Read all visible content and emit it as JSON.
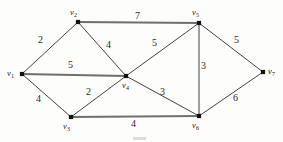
{
  "figure": {
    "type": "weighted-undirected-graph",
    "caption": "",
    "width": 283,
    "height": 142,
    "background_color": "#fdfdfc",
    "edge_color": "#2e2e2e",
    "highlight_edge_color": "#6f6f6f",
    "vertex_color": "#121212"
  },
  "vertices": [
    {
      "id": "v1",
      "label": "v",
      "sub": "1",
      "x": 22,
      "y": 74,
      "label_x": 7,
      "label_y": 69
    },
    {
      "id": "v2",
      "label": "v",
      "sub": "2",
      "x": 78,
      "y": 22,
      "label_x": 70,
      "label_y": 8
    },
    {
      "id": "v3",
      "label": "v",
      "sub": "3",
      "x": 71,
      "y": 117,
      "label_x": 63,
      "label_y": 122
    },
    {
      "id": "v4",
      "label": "v",
      "sub": "4",
      "x": 126,
      "y": 76,
      "label_x": 122,
      "label_y": 81
    },
    {
      "id": "v5",
      "label": "v",
      "sub": "5",
      "x": 199,
      "y": 23,
      "label_x": 192,
      "label_y": 8
    },
    {
      "id": "v6",
      "label": "v",
      "sub": "6",
      "x": 199,
      "y": 116,
      "label_x": 192,
      "label_y": 121
    },
    {
      "id": "v7",
      "label": "v",
      "sub": "7",
      "x": 263,
      "y": 72,
      "label_x": 268,
      "label_y": 67
    }
  ],
  "edges": [
    {
      "id": "e-v1-v2",
      "from": "v1",
      "to": "v2",
      "weight": "2",
      "weight_x": 38,
      "weight_y": 35,
      "thick": false
    },
    {
      "id": "e-v1-v4",
      "from": "v1",
      "to": "v4",
      "weight": "5",
      "weight_x": 68,
      "weight_y": 60,
      "thick": true
    },
    {
      "id": "e-v1-v3",
      "from": "v1",
      "to": "v3",
      "weight": "4",
      "weight_x": 36,
      "weight_y": 94,
      "thick": false
    },
    {
      "id": "e-v2-v5",
      "from": "v2",
      "to": "v5",
      "weight": "7",
      "weight_x": 135,
      "weight_y": 11,
      "thick": true
    },
    {
      "id": "e-v2-v4",
      "from": "v2",
      "to": "v4",
      "weight": "4",
      "weight_x": 106,
      "weight_y": 40,
      "thick": false
    },
    {
      "id": "e-v3-v4",
      "from": "v3",
      "to": "v4",
      "weight": "2",
      "weight_x": 86,
      "weight_y": 87,
      "thick": false
    },
    {
      "id": "e-v3-v6",
      "from": "v3",
      "to": "v6",
      "weight": "4",
      "weight_x": 131,
      "weight_y": 119,
      "thick": true
    },
    {
      "id": "e-v4-v5",
      "from": "v4",
      "to": "v5",
      "weight": "5",
      "weight_x": 152,
      "weight_y": 38,
      "thick": false
    },
    {
      "id": "e-v4-v6",
      "from": "v4",
      "to": "v6",
      "weight": "3",
      "weight_x": 160,
      "weight_y": 87,
      "thick": false
    },
    {
      "id": "e-v5-v6",
      "from": "v5",
      "to": "v6",
      "weight": "3",
      "weight_x": 201,
      "weight_y": 61,
      "thick": false
    },
    {
      "id": "e-v5-v7",
      "from": "v5",
      "to": "v7",
      "weight": "5",
      "weight_x": 234,
      "weight_y": 35,
      "thick": false
    },
    {
      "id": "e-v6-v7",
      "from": "v6",
      "to": "v7",
      "weight": "6",
      "weight_x": 233,
      "weight_y": 93,
      "thick": false
    }
  ]
}
